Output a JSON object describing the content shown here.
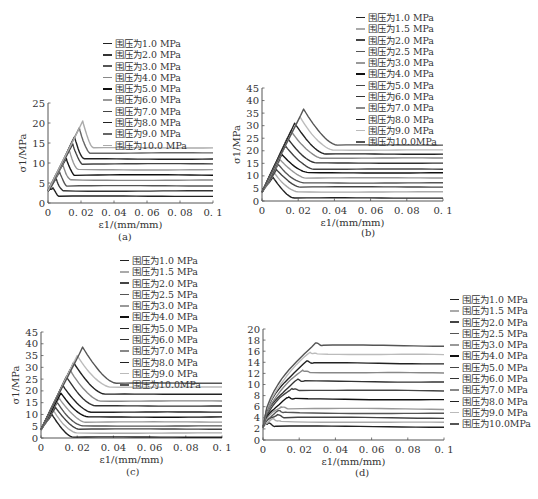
{
  "figure": {
    "captions": [
      "(a)",
      "(b)",
      "(c)",
      "(d)"
    ]
  },
  "chart_data": [
    {
      "id": "a",
      "type": "line",
      "title": "",
      "caption": "(a)",
      "xlabel": "ε1/(mm/mm)",
      "ylabel": "σ1/MPa",
      "xlim": [
        0,
        0.1
      ],
      "ylim": [
        0,
        25
      ],
      "xticks": [
        "0",
        "0.02",
        "0.04",
        "0.06",
        "0.08",
        "0.1"
      ],
      "yticks": [
        "0",
        "5",
        "10",
        "15",
        "20",
        "25"
      ],
      "grid": false,
      "legend_position": "top-center",
      "series": [
        {
          "name": "围压为1.0 MPa",
          "color": "#222222",
          "peak": [
            0.003,
            3.8
          ],
          "residual": 1.7
        },
        {
          "name": "围压为2.0 MPa",
          "color": "#333333",
          "peak": [
            0.005,
            6.0
          ],
          "residual": 3.0
        },
        {
          "name": "围压为3.0 MPa",
          "color": "#555555",
          "peak": [
            0.007,
            7.8
          ],
          "residual": 4.3
        },
        {
          "name": "围压为4.0 MPa",
          "color": "#888888",
          "peak": [
            0.009,
            9.5
          ],
          "residual": 5.7
        },
        {
          "name": "围压为5.0 MPa",
          "color": "#111111",
          "peak": [
            0.011,
            11.2
          ],
          "residual": 7.0
        },
        {
          "name": "围压为6.0 MPa",
          "color": "#999999",
          "peak": [
            0.013,
            13.0
          ],
          "residual": 8.3
        },
        {
          "name": "围压为7.0 MPa",
          "color": "#444444",
          "peak": [
            0.015,
            14.8
          ],
          "residual": 9.8
        },
        {
          "name": "围压为8.0 MPa",
          "color": "#222222",
          "peak": [
            0.016,
            16.5
          ],
          "residual": 11.0
        },
        {
          "name": "围压为9.0 MPa",
          "color": "#666666",
          "peak": [
            0.019,
            18.8
          ],
          "residual": 12.5
        },
        {
          "name": "围压为10.0 MPa",
          "color": "#aaaaaa",
          "peak": [
            0.021,
            20.5
          ],
          "residual": 13.8
        }
      ]
    },
    {
      "id": "b",
      "type": "line",
      "title": "",
      "caption": "(b)",
      "xlabel": "ε1/(mm/mm)",
      "ylabel": "σ1/MPa",
      "xlim": [
        0,
        0.1
      ],
      "ylim": [
        0,
        45
      ],
      "xticks": [
        "0",
        "0.02",
        "0.04",
        "0.06",
        "0.08",
        "0.1"
      ],
      "yticks": [
        "0",
        "5",
        "10",
        "15",
        "20",
        "25",
        "30",
        "35",
        "40",
        "45"
      ],
      "grid": false,
      "legend_position": "top-right",
      "series": [
        {
          "name": "围压为1.0 MPa",
          "color": "#222222",
          "peak": [
            0.006,
            9.5
          ],
          "residual": 1.2
        },
        {
          "name": "围压为1.5 MPa",
          "color": "#aaaaaa",
          "peak": [
            0.007,
            11.0
          ],
          "residual": 3.6
        },
        {
          "name": "围压为2.0 MPa",
          "color": "#444444",
          "peak": [
            0.008,
            12.5
          ],
          "residual": 5.6
        },
        {
          "name": "围压为2.5 MPa",
          "color": "#555555",
          "peak": [
            0.009,
            14.5
          ],
          "residual": 7.2
        },
        {
          "name": "围压为3.0 MPa",
          "color": "#999999",
          "peak": [
            0.01,
            16.5
          ],
          "residual": 9.2
        },
        {
          "name": "围压为4.0 MPa",
          "color": "#111111",
          "peak": [
            0.011,
            18.5
          ],
          "residual": 11.2
        },
        {
          "name": "围压为5.0 MPa",
          "color": "#444444",
          "peak": [
            0.013,
            22.0
          ],
          "residual": 12.7
        },
        {
          "name": "围压为6.0 MPa",
          "color": "#333333",
          "peak": [
            0.014,
            25.0
          ],
          "residual": 15.1
        },
        {
          "name": "围压为7.0 MPa",
          "color": "#888888",
          "peak": [
            0.016,
            28.0
          ],
          "residual": 17.1
        },
        {
          "name": "围压为8.0 MPa",
          "color": "#222222",
          "peak": [
            0.018,
            31.0
          ],
          "residual": 18.7
        },
        {
          "name": "围压为9.0 MPa",
          "color": "#bbbbbb",
          "peak": [
            0.021,
            33.5
          ],
          "residual": 20.3
        },
        {
          "name": "围压为10.0MPa",
          "color": "#555555",
          "peak": [
            0.023,
            36.6
          ],
          "residual": 22.3
        }
      ]
    },
    {
      "id": "c",
      "type": "line",
      "title": "",
      "caption": "(c)",
      "xlabel": "ε1/(mm/mm)",
      "ylabel": "σ1/MPa",
      "xlim": [
        0,
        0.1
      ],
      "ylim": [
        0,
        45
      ],
      "xticks": [
        "0",
        "0.02",
        "0.04",
        "0.06",
        "0.08",
        "0.1"
      ],
      "yticks": [
        "0",
        "5",
        "10",
        "15",
        "20",
        "25",
        "30",
        "35",
        "40",
        "45"
      ],
      "grid": false,
      "legend_position": "top-right",
      "series": [
        {
          "name": "围压为1.0 MPa",
          "color": "#222222",
          "peak": [
            0.006,
            10.0
          ],
          "residual": 0.4
        },
        {
          "name": "围压为1.5 MPa",
          "color": "#aaaaaa",
          "peak": [
            0.007,
            11.5
          ],
          "residual": 2.1
        },
        {
          "name": "围压为2.0 MPa",
          "color": "#444444",
          "peak": [
            0.008,
            13.0
          ],
          "residual": 3.8
        },
        {
          "name": "围压为2.5 MPa",
          "color": "#555555",
          "peak": [
            0.009,
            15.0
          ],
          "residual": 5.1
        },
        {
          "name": "围压为3.0 MPa",
          "color": "#999999",
          "peak": [
            0.01,
            17.0
          ],
          "residual": 6.8
        },
        {
          "name": "围压为4.0 MPa",
          "color": "#111111",
          "peak": [
            0.011,
            19.0
          ],
          "residual": 8.9
        },
        {
          "name": "围压为5.0 MPa",
          "color": "#222222",
          "peak": [
            0.012,
            22.5
          ],
          "residual": 11.0
        },
        {
          "name": "围压为6.0 MPa",
          "color": "#333333",
          "peak": [
            0.014,
            26.0
          ],
          "residual": 13.6
        },
        {
          "name": "围压为7.0 MPa",
          "color": "#888888",
          "peak": [
            0.016,
            29.0
          ],
          "residual": 15.7
        },
        {
          "name": "围压为8.0 MPa",
          "color": "#222222",
          "peak": [
            0.018,
            32.0
          ],
          "residual": 18.6
        },
        {
          "name": "围压为9.0 MPa",
          "color": "#bbbbbb",
          "peak": [
            0.02,
            35.0
          ],
          "residual": 21.6
        },
        {
          "name": "围压为10.0MPa",
          "color": "#555555",
          "peak": [
            0.023,
            38.6
          ],
          "residual": 23.3
        }
      ]
    },
    {
      "id": "d",
      "type": "line",
      "title": "",
      "caption": "(d)",
      "xlabel": "ε1/(mm/mm)",
      "ylabel": "σ1/MPa",
      "xlim": [
        0,
        0.1
      ],
      "ylim": [
        0,
        20
      ],
      "xticks": [
        "0",
        "0.02",
        "0.04",
        "0.06",
        "0.08",
        "0.1"
      ],
      "yticks": [
        "0",
        "2",
        "4",
        "6",
        "8",
        "10",
        "12",
        "14",
        "16",
        "18",
        "20"
      ],
      "grid": false,
      "legend_position": "right",
      "series": [
        {
          "name": "围压为1.0 MPa",
          "color": "#222222",
          "peak": [
            0.003,
            3.1
          ],
          "residual": 2.5
        },
        {
          "name": "围压为1.5 MPa",
          "color": "#aaaaaa",
          "peak": [
            0.006,
            3.8
          ],
          "residual": 3.3
        },
        {
          "name": "围压为2.0 MPa",
          "color": "#444444",
          "peak": [
            0.008,
            4.6
          ],
          "residual": 4.1
        },
        {
          "name": "围压为2.5 MPa",
          "color": "#555555",
          "peak": [
            0.009,
            5.3
          ],
          "residual": 4.9
        },
        {
          "name": "围压为3.0 MPa",
          "color": "#999999",
          "peak": [
            0.01,
            6.0
          ],
          "residual": 5.7
        },
        {
          "name": "围压为4.0 MPa",
          "color": "#111111",
          "peak": [
            0.014,
            7.7
          ],
          "residual": 7.4
        },
        {
          "name": "围压为5.0 MPa",
          "color": "#444444",
          "peak": [
            0.016,
            9.3
          ],
          "residual": 9.0
        },
        {
          "name": "围压为6.0 MPa",
          "color": "#333333",
          "peak": [
            0.019,
            10.9
          ],
          "residual": 10.6
        },
        {
          "name": "围压为7.0 MPa",
          "color": "#888888",
          "peak": [
            0.022,
            12.6
          ],
          "residual": 12.2
        },
        {
          "name": "围压为8.0 MPa",
          "color": "#222222",
          "peak": [
            0.024,
            14.2
          ],
          "residual": 13.9
        },
        {
          "name": "围压为9.0 MPa",
          "color": "#bbbbbb",
          "peak": [
            0.026,
            15.8
          ],
          "residual": 15.5
        },
        {
          "name": "围压为10.0MPa",
          "color": "#555555",
          "peak": [
            0.029,
            17.5
          ],
          "residual": 17.1
        }
      ]
    }
  ]
}
